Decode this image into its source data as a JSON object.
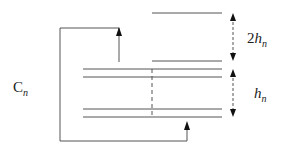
{
  "diagram": {
    "labels": {
      "cn": {
        "main": "C",
        "sub": "n"
      },
      "two_hn": {
        "coef": "2",
        "main": "h",
        "sub": "n"
      },
      "hn": {
        "main": "h",
        "sub": "n"
      }
    },
    "colors": {
      "line": "#555555",
      "arrow": "#111111"
    }
  }
}
